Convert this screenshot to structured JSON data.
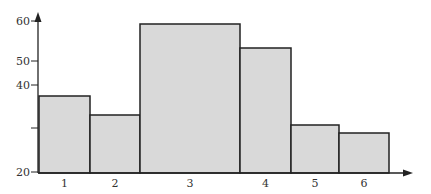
{
  "chart_data": {
    "type": "bar",
    "subtype": "histogram",
    "title": "",
    "xlabel": "",
    "ylabel": "",
    "categories": [
      "1",
      "2",
      "3",
      "4",
      "5",
      "6"
    ],
    "values": [
      37,
      33,
      59,
      53,
      31,
      29
    ],
    "bar_x_ranges_px": [
      [
        39,
        90
      ],
      [
        90,
        140
      ],
      [
        140,
        240
      ],
      [
        240,
        291
      ],
      [
        291,
        339
      ],
      [
        339,
        389
      ]
    ],
    "bar_top_px": [
      96,
      115,
      24,
      48,
      125,
      133
    ],
    "y_ticks": [
      {
        "label": "60",
        "y_px": 21
      },
      {
        "label": "50",
        "y_px": 61
      },
      {
        "label": "40",
        "y_px": 85
      },
      {
        "label": "",
        "y_px": 128
      },
      {
        "label": "20",
        "y_px": 172
      }
    ],
    "ylim": [
      20,
      62
    ],
    "grid": false,
    "legend": null,
    "bar_color": "#d9d9d9",
    "edge_color": "#222222"
  }
}
